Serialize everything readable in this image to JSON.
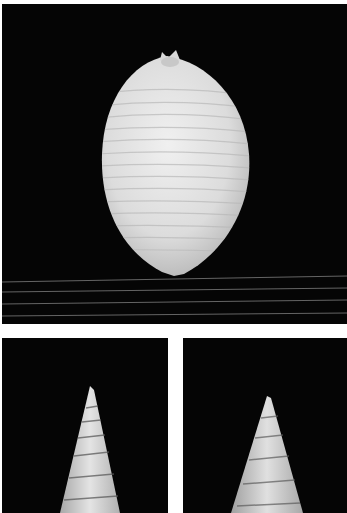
{
  "plate": {
    "background": "#ffffff",
    "panel_background": "#050505",
    "panels": [
      {
        "id": "top",
        "subject": "ovate ribbed shell, dorsal view",
        "shell_color": "#e6e6e6"
      },
      {
        "id": "bottom-left",
        "subject": "slender turreted shell spire",
        "shell_color": "#d9d9d9"
      },
      {
        "id": "bottom-right",
        "subject": "turreted shell spire with mottled bands",
        "shell_color": "#d4d4d4"
      }
    ]
  }
}
